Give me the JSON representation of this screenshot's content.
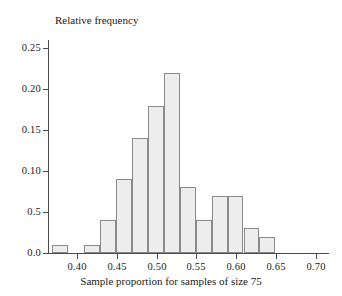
{
  "chart_data": {
    "type": "bar",
    "title": "",
    "ylabel": "Relative frequency",
    "xlabel": "Sample proportion for samples of size 75",
    "grid": false,
    "legend": null,
    "bin_width": 0.02,
    "xlim": [
      0.365,
      0.715
    ],
    "ylim": [
      0.0,
      0.26
    ],
    "xticks": [
      "0.40",
      "0.45",
      "0.50",
      "0.55",
      "0.60",
      "0.65",
      "0.70"
    ],
    "xtick_values": [
      0.4,
      0.45,
      0.5,
      0.55,
      0.6,
      0.65,
      0.7
    ],
    "yticks": [
      "0.0",
      "0.5",
      "0.10",
      "0.15",
      "0.20",
      "0.25"
    ],
    "ytick_values": [
      0.0,
      0.05,
      0.1,
      0.15,
      0.2,
      0.25
    ],
    "bins": [
      {
        "left": 0.369,
        "right": 0.389,
        "value": 0.01
      },
      {
        "left": 0.389,
        "right": 0.409,
        "value": 0.0
      },
      {
        "left": 0.409,
        "right": 0.429,
        "value": 0.01
      },
      {
        "left": 0.429,
        "right": 0.449,
        "value": 0.04
      },
      {
        "left": 0.449,
        "right": 0.469,
        "value": 0.09
      },
      {
        "left": 0.469,
        "right": 0.489,
        "value": 0.14
      },
      {
        "left": 0.489,
        "right": 0.509,
        "value": 0.18
      },
      {
        "left": 0.509,
        "right": 0.529,
        "value": 0.22
      },
      {
        "left": 0.529,
        "right": 0.549,
        "value": 0.08
      },
      {
        "left": 0.549,
        "right": 0.569,
        "value": 0.04
      },
      {
        "left": 0.569,
        "right": 0.589,
        "value": 0.07
      },
      {
        "left": 0.589,
        "right": 0.609,
        "value": 0.07
      },
      {
        "left": 0.609,
        "right": 0.629,
        "value": 0.03
      },
      {
        "left": 0.629,
        "right": 0.649,
        "value": 0.02
      }
    ],
    "categories": [
      "0.369-0.389",
      "0.389-0.409",
      "0.409-0.429",
      "0.429-0.449",
      "0.449-0.469",
      "0.469-0.489",
      "0.489-0.509",
      "0.509-0.529",
      "0.529-0.549",
      "0.549-0.569",
      "0.569-0.589",
      "0.589-0.609",
      "0.609-0.629",
      "0.629-0.649"
    ],
    "values": [
      0.01,
      0.0,
      0.01,
      0.04,
      0.09,
      0.14,
      0.18,
      0.22,
      0.08,
      0.04,
      0.07,
      0.07,
      0.03,
      0.02
    ],
    "colors": {
      "bar_fill": "#ededed",
      "bar_stroke": "#8a8a8a",
      "axis": "#4a4a4a",
      "text": "#1a1a1a",
      "background": "#ffffff"
    }
  }
}
